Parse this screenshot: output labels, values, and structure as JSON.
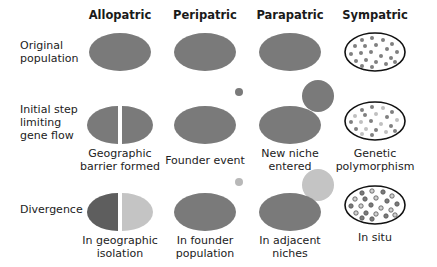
{
  "columns": [
    {
      "label": "Allopatric"
    },
    {
      "label": "Peripatric"
    },
    {
      "label": "Parapatric"
    },
    {
      "label": "Sympatric"
    }
  ],
  "rows": [
    {
      "label_line1": "Original",
      "label_line2": "population",
      "label_line3": ""
    },
    {
      "label_line1": "Initial step",
      "label_line2": "limiting",
      "label_line3": "gene flow"
    },
    {
      "label_line1": "Divergence",
      "label_line2": "",
      "label_line3": ""
    }
  ],
  "captions": {
    "initial": [
      {
        "line1": "Geographic",
        "line2": "barrier formed"
      },
      {
        "line1": "Founder event",
        "line2": ""
      },
      {
        "line1": "New niche",
        "line2": "entered"
      },
      {
        "line1": "Genetic",
        "line2": "polymorphism"
      }
    ],
    "divergence": [
      {
        "line1": "In geographic",
        "line2": "isolation"
      },
      {
        "line1": "In founder",
        "line2": "population"
      },
      {
        "line1": "In adjacent",
        "line2": "niches"
      },
      {
        "line1": "In situ",
        "line2": ""
      }
    ]
  },
  "colors": {
    "population": "#7a7a7a",
    "diverged_dark": "#5e5e5e",
    "diverged_light": "#c4c4c4",
    "small_founder_initial": "#7a7a7a",
    "small_founder_diverged": "#b8b8b8",
    "outline": "#111111",
    "dot_dark": "#808080",
    "dot_light": "#c0c0c0"
  }
}
